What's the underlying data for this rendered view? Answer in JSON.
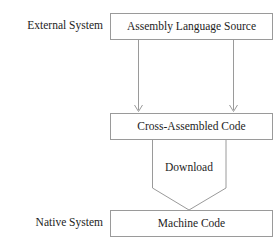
{
  "diagram": {
    "background_color": "#ffffff",
    "line_color": "#9a9a9a",
    "text_color": "#1d1d1d",
    "side_labels": [
      {
        "id": "external-system",
        "text": "External System",
        "x": 103,
        "y": 26
      },
      {
        "id": "native-system",
        "text": "Native System",
        "x": 103,
        "y": 223
      }
    ],
    "nodes": [
      {
        "id": "assembly-language-source",
        "label": "Assembly Language Source",
        "shape": "rectangle",
        "x": 110,
        "y": 13,
        "width": 163,
        "height": 27,
        "center_x": 191.5,
        "center_y": 26.5
      },
      {
        "id": "cross-assembled-code",
        "label": "Cross-Assembled Code",
        "shape": "rectangle",
        "x": 110,
        "y": 113,
        "width": 163,
        "height": 27,
        "center_x": 191.5,
        "center_y": 126.5
      },
      {
        "id": "machine-code",
        "label": "Machine Code",
        "shape": "rectangle",
        "x": 110,
        "y": 210,
        "width": 163,
        "height": 27,
        "center_x": 191.5,
        "center_y": 223.5
      }
    ],
    "edges": [
      {
        "id": "source-to-crossassembled-left",
        "from": "assembly-language-source",
        "to": "cross-assembled-code",
        "label": "",
        "type": "arrow",
        "x": 138,
        "y_start": 40,
        "y_end": 112
      },
      {
        "id": "source-to-crossassembled-right",
        "from": "assembly-language-source",
        "to": "cross-assembled-code",
        "label": "",
        "type": "arrow",
        "x": 233,
        "y_start": 40,
        "y_end": 112
      },
      {
        "id": "download-funnel",
        "from": "cross-assembled-code",
        "to": "machine-code",
        "label": "Download",
        "type": "funnel",
        "left_x": 152,
        "right_x": 226,
        "top_y": 140,
        "shoulder_y": 188,
        "tip_x": 189,
        "tip_y": 210,
        "label_x": 189,
        "label_y": 168
      }
    ]
  }
}
